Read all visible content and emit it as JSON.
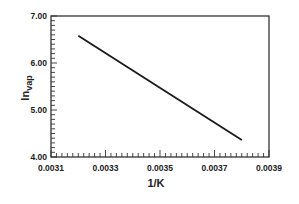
{
  "chart_data": {
    "type": "line",
    "title": "",
    "xlabel": "1/K",
    "ylabel": "ln",
    "ylabel_subscript": "vap",
    "xlim": [
      0.0031,
      0.0039
    ],
    "ylim": [
      4.0,
      7.0
    ],
    "x_ticks": [
      "0.0031",
      "0.0033",
      "0.0035",
      "0.0037",
      "0.0039"
    ],
    "y_ticks": [
      "4.00",
      "5.00",
      "6.00",
      "7.00"
    ],
    "grid": false,
    "legend": null,
    "series": [
      {
        "name": "ln vap vs 1/K",
        "color": "#1a1a1a",
        "x": [
          0.0032,
          0.0038
        ],
        "y": [
          6.58,
          4.36
        ]
      }
    ]
  },
  "axes": {
    "x_label": "1/K",
    "y_label_main": "ln",
    "y_label_sub": "vap",
    "x_tick_labels": [
      "0.0031",
      "0.0033",
      "0.0035",
      "0.0037",
      "0.0039"
    ],
    "y_tick_labels": [
      "7.00",
      "6.00",
      "5.00",
      "4.00"
    ]
  }
}
